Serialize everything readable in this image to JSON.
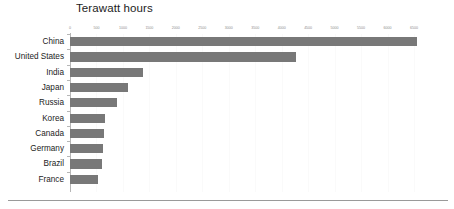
{
  "chart_data": {
    "type": "bar",
    "orientation": "horizontal",
    "title": "Terawatt hours",
    "xlabel": "",
    "ylabel": "",
    "categories": [
      "China",
      "United States",
      "India",
      "Japan",
      "Russia",
      "Korea",
      "Canada",
      "Germany",
      "Brazil",
      "France"
    ],
    "values": [
      6550,
      4280,
      1380,
      1100,
      890,
      660,
      640,
      630,
      610,
      530
    ],
    "series": [
      {
        "name": "Terawatt hours",
        "values": [
          6550,
          4280,
          1380,
          1100,
          890,
          660,
          640,
          630,
          610,
          530
        ]
      }
    ],
    "xlim": [
      0,
      6500
    ],
    "xticks": [
      0,
      500,
      1000,
      1500,
      2000,
      2500,
      3000,
      3500,
      4000,
      4500,
      5000,
      5500,
      6000,
      6500
    ],
    "xtick_labels": [
      "0",
      "500",
      "1000",
      "1500",
      "2000",
      "2500",
      "3000",
      "3500",
      "4000",
      "4500",
      "5000",
      "5500",
      "6000",
      "6500"
    ],
    "grid": true,
    "grid_axis": "x",
    "legend": false,
    "legend_position": "none",
    "bar_color": "#787878",
    "gridline_color": "#fafafa",
    "axis_color": "#b6b6b6",
    "tick_label_color": "#8e8e8e",
    "title_color": "#1c1c1c",
    "category_label_color": "#1c1c1c",
    "background_color": "#ffffff"
  }
}
